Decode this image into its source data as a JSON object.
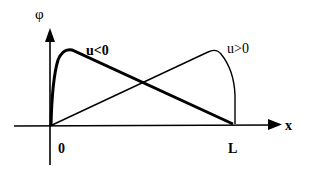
{
  "diagram": {
    "y_axis_label": "φ",
    "x_axis_label": "x",
    "origin_label": "0",
    "end_label": "L",
    "curves": [
      {
        "name": "u<0",
        "label": "u<0",
        "style": "thick",
        "description": "steep rise near 0, peak near left, linear decline to L"
      },
      {
        "name": "u>0",
        "label": "u>0",
        "style": "thin",
        "description": "linear rise from 0, peak near right, steep drop at L"
      }
    ],
    "colors": {
      "line": "#000000",
      "background": "#ffffff"
    }
  }
}
